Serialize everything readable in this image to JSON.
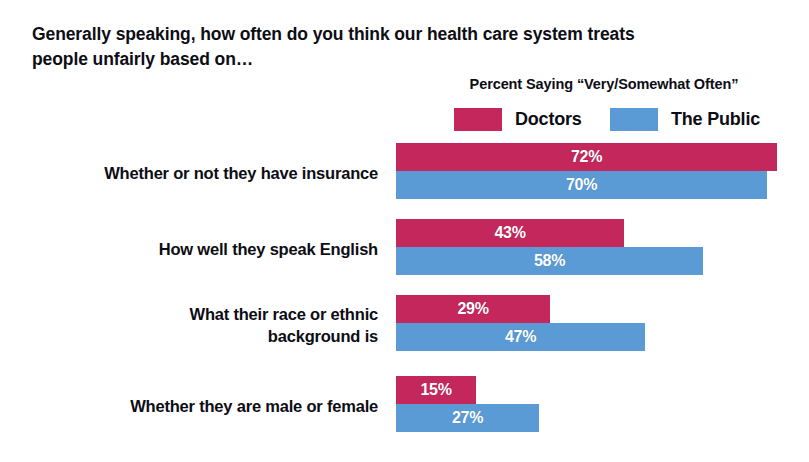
{
  "title": {
    "line1": "Generally speaking, how often do you think our health care system treats",
    "line2": "people unfairly based on…"
  },
  "legend": {
    "header": "Percent Saying “Very/Somewhat Often”",
    "items": [
      {
        "label": "Doctors",
        "color": "#C3275C"
      },
      {
        "label": "The Public",
        "color": "#5B9BD5"
      }
    ]
  },
  "chart_data": {
    "type": "bar",
    "orientation": "horizontal",
    "title": "Generally speaking, how often do you think our health care system treats people unfairly based on…",
    "subtitle": "Percent Saying “Very/Somewhat Often”",
    "xlabel": "",
    "ylabel": "",
    "xlim": [
      0,
      80
    ],
    "grid": false,
    "legend_position": "top-right",
    "value_suffix": "%",
    "categories": [
      "Whether or not they have insurance",
      "How well they speak English",
      "What their race or ethnic background is",
      "Whether they are male or female"
    ],
    "series": [
      {
        "name": "Doctors",
        "color": "#C3275C",
        "values": [
          72,
          43,
          29,
          15
        ]
      },
      {
        "name": "The Public",
        "color": "#5B9BD5",
        "values": [
          70,
          58,
          47,
          27
        ]
      }
    ]
  },
  "groups": [
    {
      "label_lines": [
        "Whether or not they have insurance"
      ],
      "top": 5,
      "label_top": 24,
      "bars": [
        {
          "series": "Doctors",
          "value": 72,
          "value_label": "72%",
          "color": "#C3275C",
          "width_px": 381
        },
        {
          "series": "The Public",
          "value": 70,
          "value_label": "70%",
          "color": "#5B9BD5",
          "width_px": 371
        }
      ]
    },
    {
      "label_lines": [
        "How well they speak English"
      ],
      "top": 81,
      "label_top": 100,
      "bars": [
        {
          "series": "Doctors",
          "value": 43,
          "value_label": "43%",
          "color": "#C3275C",
          "width_px": 228
        },
        {
          "series": "The Public",
          "value": 58,
          "value_label": "58%",
          "color": "#5B9BD5",
          "width_px": 307
        }
      ]
    },
    {
      "label_lines": [
        "What their race or ethnic",
        "background is"
      ],
      "top": 157,
      "label_top": 165,
      "bars": [
        {
          "series": "Doctors",
          "value": 29,
          "value_label": "29%",
          "color": "#C3275C",
          "width_px": 154
        },
        {
          "series": "The Public",
          "value": 47,
          "value_label": "47%",
          "color": "#5B9BD5",
          "width_px": 249
        }
      ]
    },
    {
      "label_lines": [
        "Whether they are male or female"
      ],
      "top": 238,
      "label_top": 257,
      "bars": [
        {
          "series": "Doctors",
          "value": 15,
          "value_label": "15%",
          "color": "#C3275C",
          "width_px": 80
        },
        {
          "series": "The Public",
          "value": 27,
          "value_label": "27%",
          "color": "#5B9BD5",
          "width_px": 143
        }
      ]
    }
  ]
}
